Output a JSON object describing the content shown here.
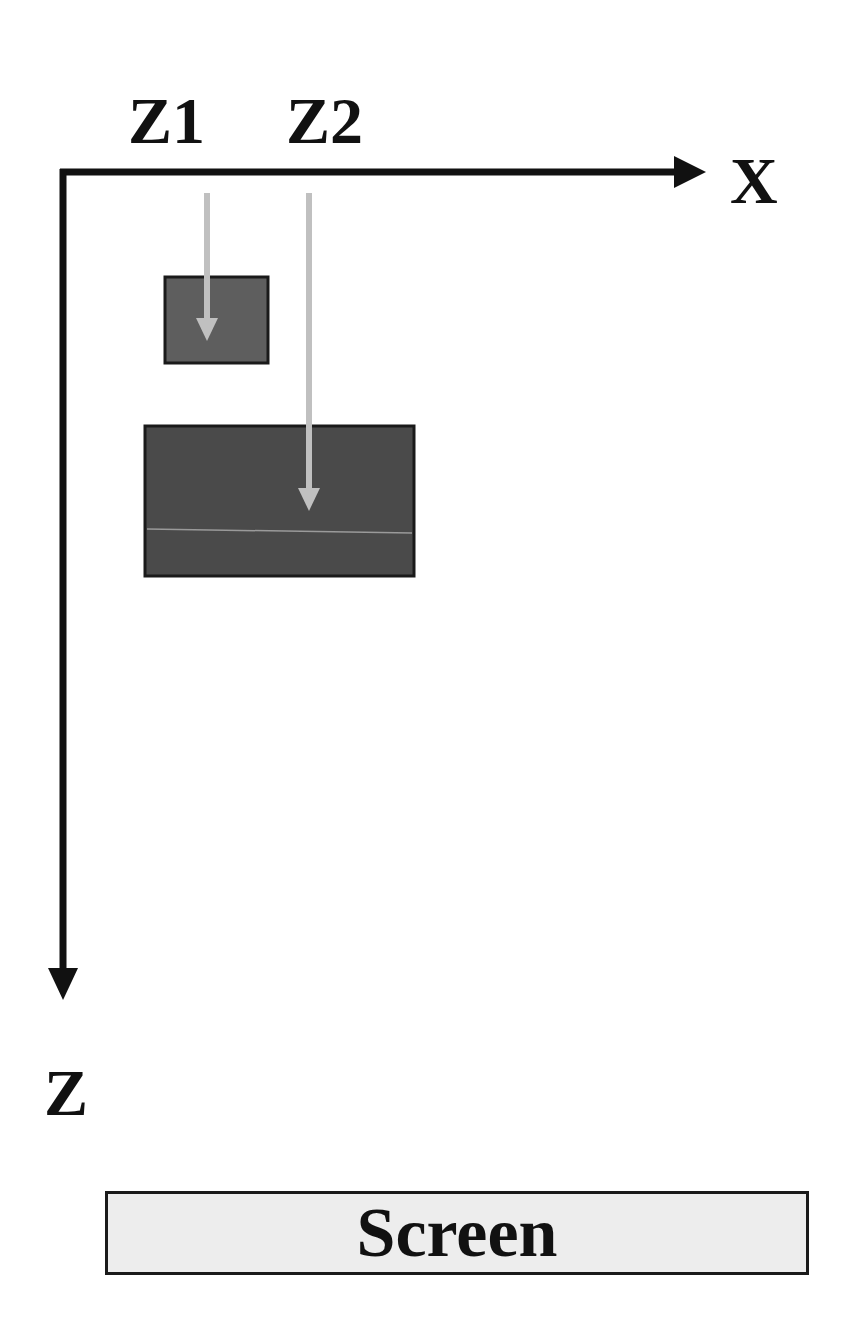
{
  "diagram": {
    "axes": {
      "x_label": "X",
      "z_label": "Z"
    },
    "depth_labels": [
      "Z1",
      "Z2"
    ],
    "objects": [
      {
        "name": "near-object",
        "depth": "Z1",
        "size": "small"
      },
      {
        "name": "far-object",
        "depth": "Z2",
        "size": "large"
      }
    ],
    "screen_label": "Screen",
    "colors": {
      "axis": "#111111",
      "object_fill": "#5e5e5e",
      "object_border": "#1a1a1a",
      "depth_arrow": "#c0c0c0",
      "screen_fill": "#ededed"
    }
  }
}
